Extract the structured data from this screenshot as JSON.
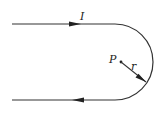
{
  "diagram": {
    "title": "",
    "labels": {
      "current": "I",
      "point": "P",
      "radius": "r"
    },
    "colors": {
      "wire": "#333333",
      "background": "#ffffff"
    },
    "elements": [
      {
        "type": "wire-straight",
        "direction": "right",
        "position": "top"
      },
      {
        "type": "wire-semicircle",
        "side": "right"
      },
      {
        "type": "wire-straight",
        "direction": "left",
        "position": "bottom"
      },
      {
        "type": "point",
        "label": "P"
      },
      {
        "type": "radius-vector",
        "label": "r"
      }
    ]
  }
}
